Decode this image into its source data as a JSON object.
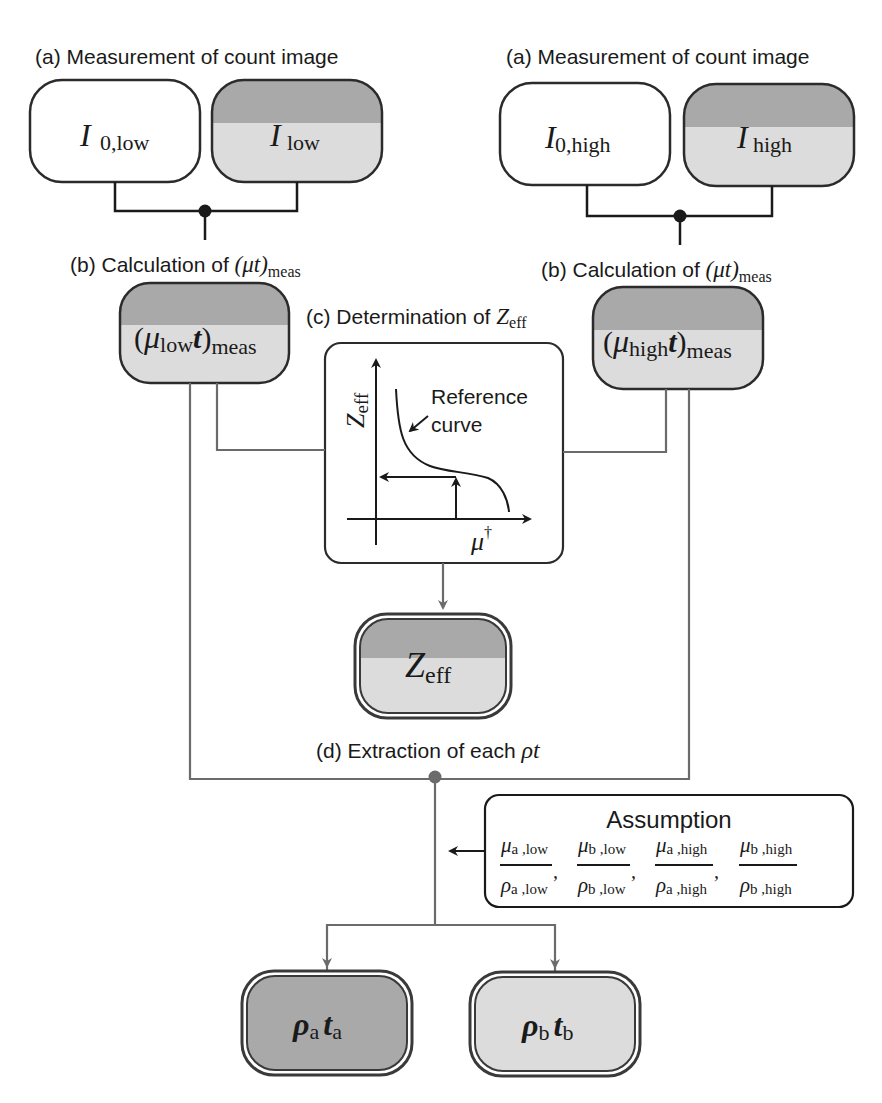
{
  "figure": {
    "colors": {
      "dark_fill": "#a9a9a9",
      "light_fill": "#dcdcdc",
      "stroke": "#2b2b2b",
      "connector_black": "#1a1a1a",
      "connector_gray": "#6b6b6b",
      "background": "#ffffff"
    },
    "left_branch": {
      "step_a_label": "(a) Measurement of count image",
      "box_i0": {
        "main": "I",
        "sub": "0,low"
      },
      "box_i": {
        "main": "I",
        "sub": "low"
      },
      "step_b_label_prefix": "(b) Calculation of ",
      "step_b_math": "(μt)",
      "step_b_sub": "meas",
      "box_mu_t": {
        "open": "(",
        "mu": "μ",
        "mu_sub": "low",
        "t": "t",
        "close": ")",
        "sub": "meas"
      }
    },
    "right_branch": {
      "step_a_label": "(a) Measurement of count image",
      "box_i0": {
        "main": "I",
        "sub": "0,high"
      },
      "box_i": {
        "main": "I",
        "sub": "high"
      },
      "step_b_label_prefix": "(b) Calculation of ",
      "step_b_math": "(μt)",
      "step_b_sub": "meas",
      "box_mu_t": {
        "open": "(",
        "mu": "μ",
        "mu_sub": "high",
        "t": "t",
        "close": ")",
        "sub": "meas"
      }
    },
    "step_c": {
      "label_prefix": "(c) Determination of ",
      "label_math": "Z",
      "label_sub": "eff",
      "plot": {
        "y_axis_label": "Z",
        "y_axis_sub": "eff",
        "x_axis_label": "μ",
        "x_axis_sup": "†",
        "curve_label_line1": "Reference",
        "curve_label_line2": "curve"
      }
    },
    "zeff_box": {
      "main": "Z",
      "sub": "eff"
    },
    "step_d": {
      "label_prefix": "(d) Extraction of each ",
      "label_math": "ρt"
    },
    "assumption": {
      "title": "Assumption",
      "fractions": [
        {
          "num": "μ",
          "num_sub": "a ,low",
          "den": "ρ",
          "den_sub": "a ,low"
        },
        {
          "num": "μ",
          "num_sub": "b ,low",
          "den": "ρ",
          "den_sub": "b ,low"
        },
        {
          "num": "μ",
          "num_sub": "a ,high",
          "den": "ρ",
          "den_sub": "a ,high"
        },
        {
          "num": "μ",
          "num_sub": "b ,high",
          "den": "ρ",
          "den_sub": "b ,high"
        }
      ],
      "separator": ","
    },
    "outputs": [
      {
        "rho": "ρ",
        "rho_sub": "a",
        "t": "t",
        "t_sub": "a"
      },
      {
        "rho": "ρ",
        "rho_sub": "b",
        "t": "t",
        "t_sub": "b"
      }
    ]
  }
}
